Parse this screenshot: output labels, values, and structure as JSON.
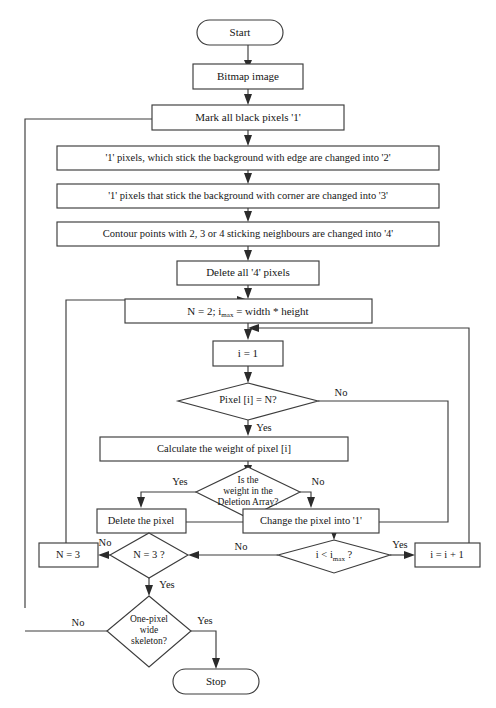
{
  "document": {
    "type": "flowchart",
    "title": "Skeletonization algorithm flowchart",
    "background_color": "#ffffff",
    "line_color": "#3c3c3c",
    "text_color": "#161616"
  },
  "nodes": {
    "start": {
      "label": "Start",
      "shape": "terminator"
    },
    "bitmap": {
      "label": "Bitmap image",
      "shape": "process"
    },
    "mark_black": {
      "label": "Mark all black pixels '1'",
      "shape": "process"
    },
    "edge_to_2": {
      "label": "'1' pixels, which stick the background with edge are changed into '2'",
      "shape": "process"
    },
    "corner_to_3": {
      "label": "'1' pixels that stick the background with corner are changed into '3'",
      "shape": "process"
    },
    "contour_to_4": {
      "label": "Contour points with 2, 3 or 4 sticking neighbours are changed into '4'",
      "shape": "process"
    },
    "delete_4": {
      "label": "Delete all '4' pixels",
      "shape": "process"
    },
    "init_n": {
      "label_prefix": "N = 2; i",
      "label_subscript": "max",
      "label_suffix": " = width * height",
      "shape": "process"
    },
    "init_i": {
      "label": "i = 1",
      "shape": "process"
    },
    "pixel_eq_n": {
      "label": "Pixel [i] = N?",
      "shape": "decision"
    },
    "calc_weight": {
      "label": "Calculate the weight of pixel [i]",
      "shape": "process"
    },
    "deletion_array": {
      "label_line1": "Is the",
      "label_line2": "weight in the",
      "label_line3": "Deletion Array?",
      "shape": "decision"
    },
    "delete_pixel": {
      "label": "Delete the pixel",
      "shape": "process"
    },
    "change_pixel": {
      "label": "Change the pixel into '1'",
      "shape": "process"
    },
    "i_lt_imax": {
      "label_prefix": "i < i",
      "label_subscript": "max",
      "label_suffix": " ?",
      "shape": "decision"
    },
    "incr_i": {
      "label": "i = i + 1",
      "shape": "process"
    },
    "n_eq_3_q": {
      "label": "N = 3 ?",
      "shape": "decision"
    },
    "set_n3": {
      "label": "N = 3",
      "shape": "process"
    },
    "one_pixel": {
      "label_line1": "One-pixel",
      "label_line2": "wide",
      "label_line3": "skeleton?",
      "shape": "decision"
    },
    "stop": {
      "label": "Stop",
      "shape": "terminator"
    }
  },
  "edge_labels": {
    "pixel_no": "No",
    "pixel_yes": "Yes",
    "deletion_yes": "Yes",
    "deletion_no": "No",
    "imax_no": "No",
    "imax_yes": "Yes",
    "n3_no": "No",
    "n3_yes": "Yes",
    "set_n3_no": "No",
    "skeleton_no": "No",
    "skeleton_yes": "Yes"
  }
}
